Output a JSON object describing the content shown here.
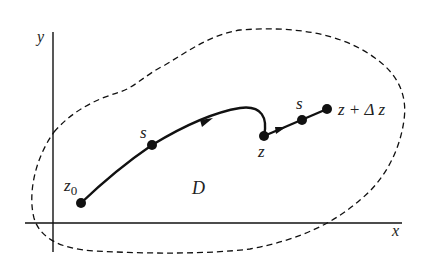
{
  "diagram": {
    "type": "complex-plane path diagram",
    "axes": {
      "x_label": "x",
      "y_label": "y"
    },
    "region": {
      "label": "D",
      "boundary_style": "dashed"
    },
    "points": {
      "start": {
        "label": "z",
        "subscript": "0"
      },
      "s1": {
        "label": "s"
      },
      "z": {
        "label": "z"
      },
      "s2": {
        "label": "s"
      },
      "end": {
        "label": "z + Δ z"
      }
    },
    "colors": {
      "stroke": "#111111",
      "background": "#ffffff"
    }
  }
}
